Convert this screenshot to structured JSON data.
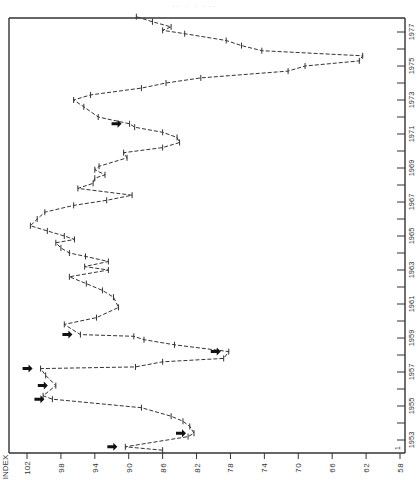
{
  "page": {
    "ghost_title": "·· · · ···"
  },
  "chart_data": {
    "type": "line",
    "orientation": "rotated-90",
    "title": "",
    "xlabel": "INDEX",
    "ylabel": "",
    "index_axis": {
      "label": "INDEX",
      "ticks": [
        102,
        98,
        94,
        90,
        86,
        82,
        78,
        74,
        70,
        66,
        62,
        58
      ],
      "range": [
        102,
        58
      ]
    },
    "time_axis": {
      "ticks": [
        "1953",
        "1955",
        "1957",
        "1959",
        "1961",
        "1963",
        "1965",
        "1967",
        "1969",
        "1971",
        "1973",
        "1975",
        "1977"
      ],
      "first_tick_label": "1",
      "range": [
        1952.5,
        1977
      ]
    },
    "grid": false,
    "style": "dashed line with tick markers",
    "series": [
      {
        "name": "Index",
        "points": [
          {
            "t": 1952.4,
            "v": 86.0
          },
          {
            "t": 1952.6,
            "v": 90.4,
            "arrow": true
          },
          {
            "t": 1953.2,
            "v": 83.0
          },
          {
            "t": 1953.4,
            "v": 82.3,
            "arrow": true
          },
          {
            "t": 1953.8,
            "v": 82.8
          },
          {
            "t": 1954.1,
            "v": 83.6
          },
          {
            "t": 1954.4,
            "v": 85.0
          },
          {
            "t": 1954.9,
            "v": 88.5
          },
          {
            "t": 1955.4,
            "v": 99.0,
            "arrow": true
          },
          {
            "t": 1955.6,
            "v": 100.1
          },
          {
            "t": 1956.2,
            "v": 98.6,
            "arrow": true
          },
          {
            "t": 1956.8,
            "v": 99.8
          },
          {
            "t": 1957.2,
            "v": 100.4,
            "arrow": true
          },
          {
            "t": 1957.3,
            "v": 89.2
          },
          {
            "t": 1957.6,
            "v": 86.0
          },
          {
            "t": 1957.8,
            "v": 78.8
          },
          {
            "t": 1958.2,
            "v": 78.2,
            "arrow": true
          },
          {
            "t": 1958.6,
            "v": 84.6
          },
          {
            "t": 1958.9,
            "v": 88.2
          },
          {
            "t": 1959.1,
            "v": 89.4
          },
          {
            "t": 1959.2,
            "v": 95.7,
            "arrow": true
          },
          {
            "t": 1959.8,
            "v": 97.6
          },
          {
            "t": 1960.2,
            "v": 93.8
          },
          {
            "t": 1960.8,
            "v": 91.2
          },
          {
            "t": 1961.4,
            "v": 91.8
          },
          {
            "t": 1961.8,
            "v": 93.1
          },
          {
            "t": 1962.2,
            "v": 95.0
          },
          {
            "t": 1962.6,
            "v": 97.0
          },
          {
            "t": 1963.0,
            "v": 92.4
          },
          {
            "t": 1963.2,
            "v": 95.2
          },
          {
            "t": 1963.5,
            "v": 92.4
          },
          {
            "t": 1963.8,
            "v": 95.1
          },
          {
            "t": 1964.0,
            "v": 97.0
          },
          {
            "t": 1964.3,
            "v": 98.0
          },
          {
            "t": 1964.6,
            "v": 98.6
          },
          {
            "t": 1964.8,
            "v": 96.4
          },
          {
            "t": 1965.0,
            "v": 97.6
          },
          {
            "t": 1965.3,
            "v": 99.6
          },
          {
            "t": 1965.6,
            "v": 101.6
          },
          {
            "t": 1966.0,
            "v": 100.8
          },
          {
            "t": 1966.4,
            "v": 99.9
          },
          {
            "t": 1966.8,
            "v": 96.5
          },
          {
            "t": 1967.1,
            "v": 92.6
          },
          {
            "t": 1967.4,
            "v": 89.6
          },
          {
            "t": 1967.8,
            "v": 96.0
          },
          {
            "t": 1968.1,
            "v": 94.2
          },
          {
            "t": 1968.4,
            "v": 94.0
          },
          {
            "t": 1968.6,
            "v": 92.8
          },
          {
            "t": 1968.9,
            "v": 94.0
          },
          {
            "t": 1969.1,
            "v": 93.5
          },
          {
            "t": 1969.6,
            "v": 90.2
          },
          {
            "t": 1969.9,
            "v": 90.6
          },
          {
            "t": 1970.2,
            "v": 86.0
          },
          {
            "t": 1970.5,
            "v": 84.0
          },
          {
            "t": 1970.8,
            "v": 84.3
          },
          {
            "t": 1971.1,
            "v": 86.0
          },
          {
            "t": 1971.4,
            "v": 89.3
          },
          {
            "t": 1971.6,
            "v": 89.9,
            "arrow": true
          },
          {
            "t": 1972.0,
            "v": 93.6
          },
          {
            "t": 1972.6,
            "v": 95.3
          },
          {
            "t": 1973.0,
            "v": 96.5
          },
          {
            "t": 1973.3,
            "v": 94.5
          },
          {
            "t": 1973.7,
            "v": 88.5
          },
          {
            "t": 1974.0,
            "v": 85.6
          },
          {
            "t": 1974.3,
            "v": 81.5
          },
          {
            "t": 1974.7,
            "v": 71.2
          },
          {
            "t": 1975.0,
            "v": 69.2
          },
          {
            "t": 1975.3,
            "v": 62.8
          },
          {
            "t": 1975.6,
            "v": 62.4
          },
          {
            "t": 1975.9,
            "v": 74.3
          },
          {
            "t": 1976.2,
            "v": 76.7
          },
          {
            "t": 1976.5,
            "v": 78.5
          },
          {
            "t": 1976.9,
            "v": 83.4
          },
          {
            "t": 1977.1,
            "v": 86.0
          },
          {
            "t": 1977.3,
            "v": 85.0
          },
          {
            "t": 1977.6,
            "v": 87.2
          },
          {
            "t": 1977.9,
            "v": 89.1
          }
        ]
      }
    ],
    "annotations": [
      "black arrows marking selected turning points"
    ]
  }
}
